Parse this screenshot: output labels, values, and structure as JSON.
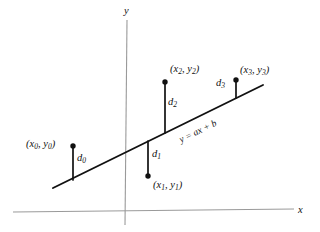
{
  "figure": {
    "type": "least-squares-regression-diagram",
    "axes": {
      "x_label": "x",
      "y_label": "y",
      "x_axis": {
        "x1": 13,
        "y1": 212,
        "x2": 294,
        "y2": 209
      },
      "y_axis": {
        "x1": 127,
        "y1": 20,
        "x2": 125,
        "y2": 225
      },
      "color": "#9a9a9a"
    },
    "regression_line": {
      "label": "y = ax + b",
      "x1": 53,
      "y1": 188,
      "x2": 263,
      "y2": 85,
      "color": "#111111"
    },
    "points": [
      {
        "id": "p0",
        "label": "(x0, y0)",
        "label_x": 0,
        "label_y": 1,
        "dot_x": 73,
        "dot_y": 146,
        "foot_x": 73,
        "foot_y": 180,
        "residual_label": "d0",
        "residual_label_x": 78,
        "residual_label_y": 157,
        "label_pos_x": 26,
        "label_pos_y": 140,
        "side": "above"
      },
      {
        "id": "p1",
        "label": "(x1, y1)",
        "dot_x": 148,
        "dot_y": 176,
        "foot_x": 148,
        "foot_y": 141,
        "residual_label": "d1",
        "residual_label_x": 152,
        "residual_label_y": 153,
        "label_pos_x": 152,
        "label_pos_y": 179,
        "side": "below"
      },
      {
        "id": "p2",
        "label": "(x2, y2)",
        "dot_x": 165,
        "dot_y": 82,
        "foot_x": 165,
        "foot_y": 133,
        "residual_label": "d2",
        "residual_label_x": 169,
        "residual_label_y": 101,
        "label_pos_x": 170,
        "label_pos_y": 65,
        "side": "above"
      },
      {
        "id": "p3",
        "label": "(x3, y3)",
        "dot_x": 236,
        "dot_y": 80,
        "foot_x": 236,
        "foot_y": 98,
        "residual_label": "d3",
        "residual_label_x": 219,
        "residual_label_y": 83,
        "label_pos_x": 241,
        "label_pos_y": 66,
        "side": "above"
      }
    ],
    "equation": {
      "text": "y = ax + b",
      "x": 180,
      "y": 136,
      "rotation": -26
    }
  }
}
